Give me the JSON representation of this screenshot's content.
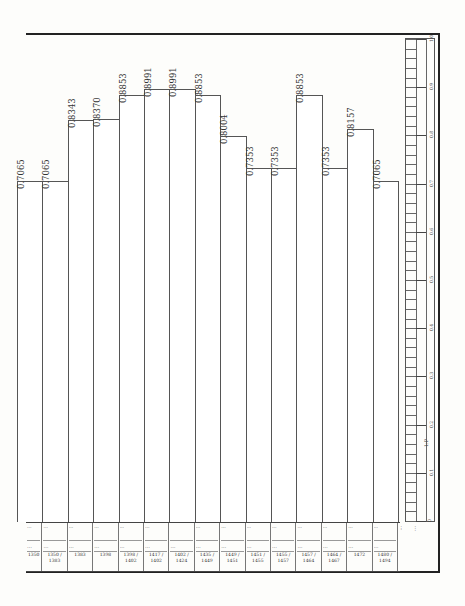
{
  "chart_data": {
    "type": "bar",
    "orientation": "vertical",
    "title": "",
    "xlabel": "",
    "ylabel": "",
    "ylim": [
      0,
      1.0
    ],
    "grid": false,
    "categories": [
      "1",
      "2",
      "3",
      "4",
      "5",
      "6",
      "7",
      "8",
      "9",
      "10",
      "11",
      "12",
      "13",
      "14",
      "15"
    ],
    "values": [
      0.7065,
      0.7065,
      0.8343,
      0.837,
      0.8853,
      0.8991,
      0.8991,
      0.8853,
      0.8004,
      0.7353,
      0.7353,
      0.8853,
      0.7353,
      0.8157,
      0.7065
    ],
    "value_labels": [
      "0.7065",
      "0.7065",
      "0.8343",
      "0.8370",
      "0.8853",
      "0.8991",
      "0.8991",
      "0.8853",
      "0.8004",
      "0.7353",
      "0.7353",
      "0.8853",
      "0.7353",
      "0.8157",
      "0.7065"
    ],
    "scale_ruler": {
      "tick_labels": [
        "1.0",
        "0.9",
        "0.8",
        "0.7",
        "0.6",
        "0.5",
        "0.4",
        "0.3",
        "0.2",
        "0.1",
        "0"
      ],
      "unit_label": "1:P"
    }
  },
  "table": {
    "columns": [
      {
        "r1": "…",
        "r2": "…",
        "r3": "1350"
      },
      {
        "r1": "…",
        "r2": "…",
        "r3": "1350 / 1383"
      },
      {
        "r1": "…",
        "r2": "…",
        "r3": "1383"
      },
      {
        "r1": "…",
        "r2": "…",
        "r3": "1398"
      },
      {
        "r1": "…",
        "r2": "…",
        "r3": "1398 / 1402"
      },
      {
        "r1": "…",
        "r2": "…",
        "r3": "1417 / 1402"
      },
      {
        "r1": "",
        "r2": "…",
        "r3": "1402 / 1424"
      },
      {
        "r1": "…",
        "r2": "…",
        "r3": "1435 / 1449"
      },
      {
        "r1": "…",
        "r2": "…",
        "r3": "1449 / 1451"
      },
      {
        "r1": "…",
        "r2": "…",
        "r3": "1451 / 1455"
      },
      {
        "r1": "…",
        "r2": "…",
        "r3": "1455 / 1457"
      },
      {
        "r1": "…",
        "r2": "…",
        "r3": "1457 / 1464"
      },
      {
        "r1": "…",
        "r2": "…",
        "r3": "1464 / 1467"
      },
      {
        "r1": "…",
        "r2": "…",
        "r3": "1472"
      },
      {
        "r1": "…",
        "r2": "…",
        "r3": "1480 / 1494"
      }
    ],
    "rank_label": "…",
    "caption": "…"
  },
  "colors": {
    "ink": "#222222",
    "paper": "#fdfdfb",
    "bar_fill": "#ffffff",
    "bar_line": "#555555"
  }
}
